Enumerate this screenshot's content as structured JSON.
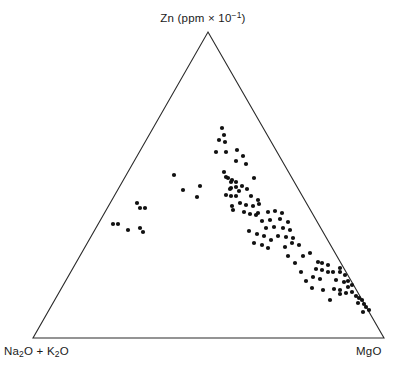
{
  "figure": {
    "type": "ternary-scatter-diagram",
    "background_color": "#ffffff",
    "line_color": "#2b2b2b",
    "point_color": "#111111"
  },
  "labels": {
    "top_vertex": "Zn (ppm × 10⁻¹)",
    "top_vertex_parts": {
      "element": "Zn",
      "unit_open": "(ppm × 10",
      "exponent": "−1",
      "unit_close": ")"
    },
    "bottom_left_vertex": "Na2O + K2O",
    "bottom_left_parts": {
      "a": "Na",
      "a_sub": "2",
      "b": "O + K",
      "b_sub": "2",
      "c": "O"
    },
    "bottom_right_vertex": "MgO"
  },
  "chart_data": {
    "type": "scatter",
    "title": "",
    "xlabel": "",
    "ylabel": "",
    "grid": false,
    "legend_position": "none",
    "axes": {
      "apex_label": "Zn (ppm × 10⁻¹)",
      "left_label": "Na2O + K2O",
      "right_label": "MgO",
      "geometry": "ternary",
      "apex_px": [
        208,
        32
      ],
      "bottom_left_px": [
        33,
        338
      ],
      "bottom_right_px": [
        384,
        338
      ]
    },
    "n_points": 112,
    "point_radius_px": 2.1,
    "points_px": [
      [
        222,
        128
      ],
      [
        224,
        135
      ],
      [
        219,
        140
      ],
      [
        225,
        142
      ],
      [
        216,
        152
      ],
      [
        226,
        152
      ],
      [
        237,
        150
      ],
      [
        243,
        156
      ],
      [
        236,
        161
      ],
      [
        246,
        164
      ],
      [
        174,
        175
      ],
      [
        183,
        190
      ],
      [
        200,
        186
      ],
      [
        197,
        197
      ],
      [
        137,
        203
      ],
      [
        140,
        208
      ],
      [
        145,
        208
      ],
      [
        113,
        224
      ],
      [
        118,
        224
      ],
      [
        128,
        230
      ],
      [
        140,
        228
      ],
      [
        143,
        232
      ],
      [
        224,
        172
      ],
      [
        228,
        178
      ],
      [
        231,
        182
      ],
      [
        231,
        188
      ],
      [
        236,
        187
      ],
      [
        242,
        186
      ],
      [
        226,
        177
      ],
      [
        232,
        180
      ],
      [
        236,
        182
      ],
      [
        254,
        178
      ],
      [
        230,
        189
      ],
      [
        239,
        191
      ],
      [
        247,
        189
      ],
      [
        226,
        195
      ],
      [
        236,
        196
      ],
      [
        251,
        196
      ],
      [
        258,
        200
      ],
      [
        231,
        196
      ],
      [
        233,
        210
      ],
      [
        232,
        206
      ],
      [
        240,
        203
      ],
      [
        246,
        205
      ],
      [
        253,
        206
      ],
      [
        259,
        204
      ],
      [
        244,
        212
      ],
      [
        250,
        214
      ],
      [
        256,
        215
      ],
      [
        258,
        213
      ],
      [
        268,
        212
      ],
      [
        275,
        211
      ],
      [
        282,
        213
      ],
      [
        262,
        221
      ],
      [
        270,
        220
      ],
      [
        280,
        219
      ],
      [
        288,
        222
      ],
      [
        266,
        228
      ],
      [
        274,
        227
      ],
      [
        283,
        228
      ],
      [
        290,
        230
      ],
      [
        278,
        236
      ],
      [
        286,
        237
      ],
      [
        293,
        238
      ],
      [
        249,
        231
      ],
      [
        257,
        234
      ],
      [
        264,
        236
      ],
      [
        271,
        240
      ],
      [
        254,
        243
      ],
      [
        262,
        245
      ],
      [
        268,
        248
      ],
      [
        292,
        243
      ],
      [
        299,
        245
      ],
      [
        285,
        247
      ],
      [
        310,
        253
      ],
      [
        303,
        256
      ],
      [
        295,
        263
      ],
      [
        318,
        262
      ],
      [
        322,
        263
      ],
      [
        328,
        265
      ],
      [
        316,
        269
      ],
      [
        322,
        270
      ],
      [
        328,
        272
      ],
      [
        333,
        272
      ],
      [
        340,
        268
      ],
      [
        306,
        281
      ],
      [
        313,
        277
      ],
      [
        320,
        279
      ],
      [
        336,
        280
      ],
      [
        344,
        282
      ],
      [
        348,
        281
      ],
      [
        340,
        272
      ],
      [
        345,
        275
      ],
      [
        334,
        289
      ],
      [
        340,
        290
      ],
      [
        348,
        287
      ],
      [
        352,
        285
      ],
      [
        340,
        294
      ],
      [
        346,
        293
      ],
      [
        352,
        292
      ],
      [
        356,
        296
      ],
      [
        359,
        298
      ],
      [
        362,
        300
      ],
      [
        358,
        303
      ],
      [
        364,
        304
      ],
      [
        366,
        307
      ],
      [
        369,
        310
      ],
      [
        363,
        312
      ],
      [
        330,
        300
      ],
      [
        323,
        290
      ],
      [
        312,
        288
      ],
      [
        301,
        272
      ],
      [
        288,
        256
      ]
    ]
  }
}
